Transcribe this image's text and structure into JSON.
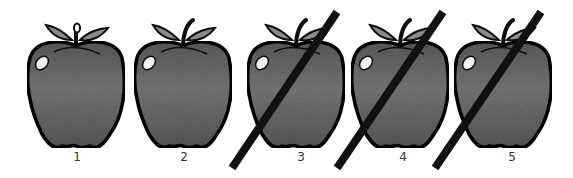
{
  "figure": {
    "colors": {
      "background": "#ffffff",
      "apple_fill": "#6e6e6e",
      "apple_outline": "#0d0d0d",
      "leaf_fill": "#8a8a8a",
      "highlight": "#f2f2f2",
      "slash": "#111111",
      "label": "#333333"
    },
    "apples": [
      {
        "label": "1",
        "crossed_out": false,
        "stem": "hollow-bud"
      },
      {
        "label": "2",
        "crossed_out": false,
        "stem": "curved"
      },
      {
        "label": "3",
        "crossed_out": true,
        "stem": "curved"
      },
      {
        "label": "4",
        "crossed_out": true,
        "stem": "curved"
      },
      {
        "label": "5",
        "crossed_out": true,
        "stem": "curved"
      }
    ]
  }
}
